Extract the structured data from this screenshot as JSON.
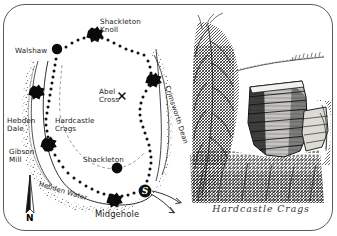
{
  "figure": {
    "panels": [
      "walk-route-map",
      "pen-and-ink-illustration"
    ]
  },
  "map": {
    "name": "hardcastle-crags-walk-map",
    "compass": {
      "label": "N"
    },
    "start_marker": {
      "label": "S"
    },
    "cross_marker": {
      "label": "x"
    },
    "labels": [
      {
        "id": "shackleton-knoll",
        "text": "Shackleton\nKnoll",
        "x": 96,
        "y": 14
      },
      {
        "id": "walshaw",
        "text": "Walshaw",
        "x": 12,
        "y": 44
      },
      {
        "id": "abel-cross",
        "text": "Abel\nCross",
        "x": 96,
        "y": 84
      },
      {
        "id": "crimsworth-dean",
        "text": "Crimsworth Dean",
        "x": 163,
        "y": 88,
        "rotated": true
      },
      {
        "id": "hebden-dale",
        "text": "Hebden\nDale",
        "x": 4,
        "y": 113
      },
      {
        "id": "hardcastle-crags",
        "text": "Hardcastle\nCrags",
        "x": 52,
        "y": 113
      },
      {
        "id": "gibson-mill",
        "text": "Gibson\nMill",
        "x": 6,
        "y": 144
      },
      {
        "id": "shackleton",
        "text": "Shackleton",
        "x": 80,
        "y": 152
      },
      {
        "id": "hebden-water",
        "text": "Hebden Water",
        "x": 36,
        "y": 180,
        "curved": true
      },
      {
        "id": "midgehole",
        "text": "Midgehole",
        "x": 92,
        "y": 208
      }
    ]
  },
  "illustration": {
    "name": "hardcastle-crags-sketch",
    "caption": "Hardcastle Crags",
    "subject": "gritstone-rock-outcrop-with-trees"
  }
}
